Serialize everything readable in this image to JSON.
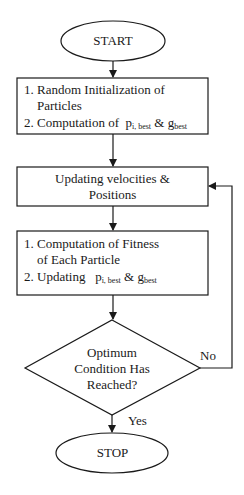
{
  "diagram": {
    "type": "flowchart",
    "nodes": {
      "start": {
        "shape": "terminator",
        "label": "START"
      },
      "init": {
        "shape": "process",
        "items": [
          {
            "num": "1.",
            "line1": "Random Initialization of",
            "line2": "Particles"
          },
          {
            "num": "2.",
            "prefix": "Computation of",
            "p": "p",
            "p_sub": "i, best",
            "amp": "&",
            "g": "g",
            "g_sub": "best"
          }
        ]
      },
      "update": {
        "shape": "process",
        "line1": "Updating velocities &",
        "line2": "Positions"
      },
      "fitness": {
        "shape": "process",
        "items": [
          {
            "num": "1.",
            "line1": "Computation of Fitness",
            "line2": "of Each Particle"
          },
          {
            "num": "2.",
            "prefix": "Updating",
            "p": "p",
            "p_sub": "i, best",
            "amp": "&",
            "g": "g",
            "g_sub": "best"
          }
        ]
      },
      "decision": {
        "shape": "decision",
        "line1": "Optimum",
        "line2": "Condition Has",
        "line3": "Reached?"
      },
      "stop": {
        "shape": "terminator",
        "label": "STOP"
      }
    },
    "edges": [
      {
        "from": "start",
        "to": "init",
        "label": ""
      },
      {
        "from": "init",
        "to": "update",
        "label": ""
      },
      {
        "from": "update",
        "to": "fitness",
        "label": ""
      },
      {
        "from": "fitness",
        "to": "decision",
        "label": ""
      },
      {
        "from": "decision",
        "to": "update",
        "label": "No"
      },
      {
        "from": "decision",
        "to": "stop",
        "label": "Yes"
      }
    ],
    "edge_labels": {
      "no": "No",
      "yes": "Yes"
    },
    "colors": {
      "stroke": "#1a1a1a",
      "background": "#ffffff"
    }
  }
}
